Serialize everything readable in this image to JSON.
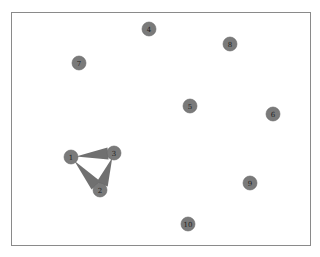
{
  "graph": {
    "node_color": "#7a7a7a",
    "edge_color": "#707070",
    "nodes": [
      {
        "id": "1",
        "label": "1",
        "x": 71,
        "y": 157
      },
      {
        "id": "2",
        "label": "2",
        "x": 100,
        "y": 190
      },
      {
        "id": "3",
        "label": "3",
        "x": 114,
        "y": 153
      },
      {
        "id": "4",
        "label": "4",
        "x": 149,
        "y": 29
      },
      {
        "id": "5",
        "label": "5",
        "x": 190,
        "y": 106
      },
      {
        "id": "6",
        "label": "6",
        "x": 273,
        "y": 114
      },
      {
        "id": "7",
        "label": "7",
        "x": 79,
        "y": 63
      },
      {
        "id": "8",
        "label": "8",
        "x": 230,
        "y": 44
      },
      {
        "id": "9",
        "label": "9",
        "x": 250,
        "y": 183
      },
      {
        "id": "10",
        "label": "10",
        "x": 188,
        "y": 224
      }
    ],
    "edges": [
      {
        "from": "1",
        "to": "3"
      },
      {
        "from": "1",
        "to": "2"
      },
      {
        "from": "3",
        "to": "2"
      }
    ]
  }
}
